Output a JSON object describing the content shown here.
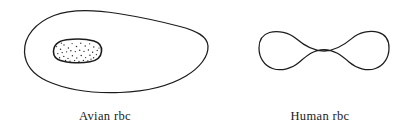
{
  "figure": {
    "background_color": "#ffffff",
    "line_color": "#1c1c1c",
    "type": "biological-diagram",
    "caption_font_style": "serif"
  },
  "cells": [
    {
      "id": "avian-rbc",
      "label": "Avian rbc",
      "shape": "oval, irregular / ellipsoid with flattened base",
      "has_nucleus": true,
      "nucleus_fill": "stippled",
      "nucleus_label": "nucleus"
    },
    {
      "id": "human-rbc",
      "label": "Human rbc",
      "shape": "biconcave disc in cross-section (dumbbell)",
      "has_nucleus": false,
      "nucleus_fill": "none",
      "nucleus_label": ""
    }
  ],
  "labels": {
    "avian": "Avian rbc",
    "human": "Human rbc"
  }
}
